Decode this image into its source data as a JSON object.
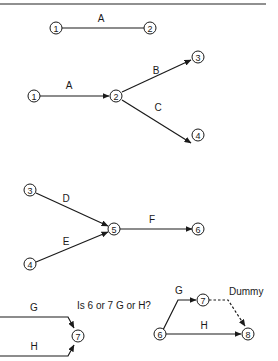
{
  "diagram": {
    "type": "activity-on-arrow network diagrams",
    "panels": [
      {
        "id": "p1",
        "nodes": [
          "1",
          "2"
        ],
        "edges": [
          {
            "from": "1",
            "to": "2",
            "label": "A",
            "arrow": false
          }
        ]
      },
      {
        "id": "p2",
        "nodes": [
          "1",
          "2",
          "3",
          "4"
        ],
        "edges": [
          {
            "from": "1",
            "to": "2",
            "label": "A"
          },
          {
            "from": "2",
            "to": "3",
            "label": "B"
          },
          {
            "from": "2",
            "to": "4",
            "label": "C"
          }
        ]
      },
      {
        "id": "p3",
        "nodes": [
          "3",
          "4",
          "5",
          "6"
        ],
        "edges": [
          {
            "from": "3",
            "to": "5",
            "label": "D"
          },
          {
            "from": "4",
            "to": "5",
            "label": "E"
          },
          {
            "from": "5",
            "to": "6",
            "label": "F"
          }
        ]
      },
      {
        "id": "p4",
        "nodes": [
          "7"
        ],
        "edges": [
          {
            "from": "?",
            "to": "7",
            "label": "G"
          },
          {
            "from": "?",
            "to": "7",
            "label": "H"
          }
        ]
      },
      {
        "id": "p5",
        "nodes": [
          "6",
          "7",
          "8"
        ],
        "edges": [
          {
            "from": "6",
            "to": "7",
            "label": "G"
          },
          {
            "from": "6",
            "to": "8",
            "label": "H"
          },
          {
            "from": "7",
            "to": "8",
            "label": "Dummy",
            "style": "dashed"
          }
        ]
      }
    ],
    "question": "Is 6 or 7 G or H?",
    "labels": {
      "A": "A",
      "B": "B",
      "C": "C",
      "D": "D",
      "E": "E",
      "F": "F",
      "G": "G",
      "H": "H",
      "dummy": "Dummy"
    },
    "node_labels": {
      "n1": "1",
      "n2": "2",
      "n3": "3",
      "n4": "4",
      "n5": "5",
      "n6": "6",
      "n7": "7",
      "n8": "8"
    }
  }
}
